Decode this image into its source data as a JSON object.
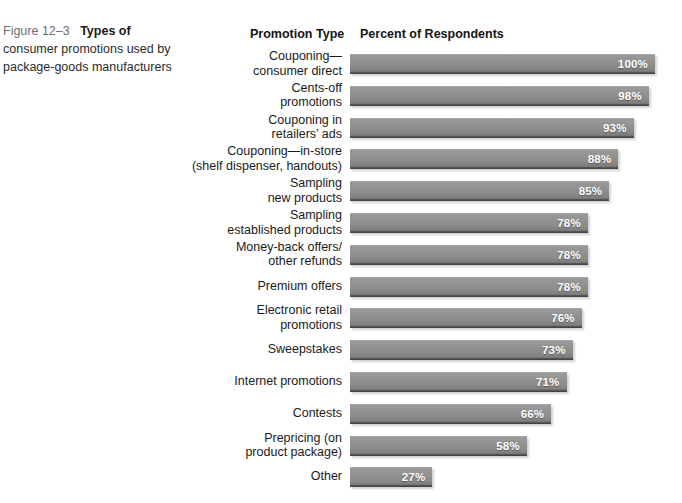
{
  "caption": {
    "figure_number": "Figure 12–3",
    "title": "Types of",
    "rest": "consumer promotions used by package-goods manufacturers",
    "full_text": "Figure 12–3   Types of consumer promotions used by package-goods manufacturers"
  },
  "chart_data": {
    "type": "bar",
    "orientation": "horizontal",
    "title": "Types of consumer promotions used by package-goods manufacturers",
    "xlabel": "Percent of Respondents",
    "ylabel": "Promotion Type",
    "column_headers": {
      "category": "Promotion Type",
      "value": "Percent of Respondents"
    },
    "xlim": [
      0,
      100
    ],
    "grid": false,
    "legend": "none",
    "value_suffix": "%",
    "bar_color": "#8c8c8c",
    "label_color": "#ffffff",
    "background": "#ffffff",
    "categories": [
      "Couponing—\nconsumer direct",
      "Cents-off\npromotions",
      "Couponing in\nretailers’ ads",
      "Couponing—in-store\n(shelf dispenser, handouts)",
      "Sampling\nnew products",
      "Sampling\nestablished products",
      "Money-back offers/\nother refunds",
      "Premium offers",
      "Electronic retail\npromotions",
      "Sweepstakes",
      "Internet promotions",
      "Contests",
      "Prepricing (on\nproduct package)",
      "Other"
    ],
    "values": [
      100,
      98,
      93,
      88,
      85,
      78,
      78,
      78,
      76,
      73,
      71,
      66,
      58,
      27
    ],
    "value_labels": [
      "100%",
      "98%",
      "93%",
      "88%",
      "85%",
      "78%",
      "78%",
      "78%",
      "76%",
      "73%",
      "71%",
      "66%",
      "58%",
      "27%"
    ],
    "rows": [
      {
        "label": "Couponing—\nconsumer direct",
        "value": 100,
        "value_label": "100%",
        "lines": 2
      },
      {
        "label": "Cents-off\npromotions",
        "value": 98,
        "value_label": "98%",
        "lines": 2
      },
      {
        "label": "Couponing in\nretailers’ ads",
        "value": 93,
        "value_label": "93%",
        "lines": 2
      },
      {
        "label": "Couponing—in-store\n(shelf dispenser, handouts)",
        "value": 88,
        "value_label": "88%",
        "lines": 2
      },
      {
        "label": "Sampling\nnew products",
        "value": 85,
        "value_label": "85%",
        "lines": 2
      },
      {
        "label": "Sampling\nestablished products",
        "value": 78,
        "value_label": "78%",
        "lines": 2
      },
      {
        "label": "Money-back offers/\nother refunds",
        "value": 78,
        "value_label": "78%",
        "lines": 2
      },
      {
        "label": "Premium offers",
        "value": 78,
        "value_label": "78%",
        "lines": 1
      },
      {
        "label": "Electronic retail\npromotions",
        "value": 76,
        "value_label": "76%",
        "lines": 2
      },
      {
        "label": "Sweepstakes",
        "value": 73,
        "value_label": "73%",
        "lines": 1
      },
      {
        "label": "Internet promotions",
        "value": 71,
        "value_label": "71%",
        "lines": 1
      },
      {
        "label": "Contests",
        "value": 66,
        "value_label": "66%",
        "lines": 1
      },
      {
        "label": "Prepricing (on\nproduct package)",
        "value": 58,
        "value_label": "58%",
        "lines": 2
      },
      {
        "label": "Other",
        "value": 27,
        "value_label": "27%",
        "lines": 1
      }
    ]
  },
  "layout": {
    "bar_origin_x": 350,
    "px_per_percent": 3.05,
    "first_row_top": 50,
    "row_pitch": 31.8,
    "bar_height": 20
  }
}
